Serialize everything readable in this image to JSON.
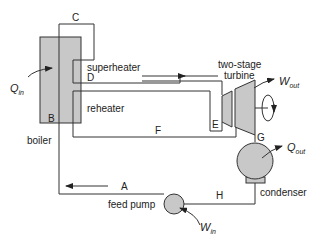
{
  "diagram": {
    "type": "Rankine cycle with reheat",
    "components": {
      "boiler": "boiler",
      "superheater": "superheater",
      "reheater": "reheater",
      "turbine": "two-stage",
      "turbine_line2": "turbine",
      "condenser": "condenser",
      "pump": "feed pump"
    },
    "state_points": {
      "A": "A",
      "B": "B",
      "C": "C",
      "D": "D",
      "E": "E",
      "F": "F",
      "G": "G",
      "H": "H"
    },
    "energy": {
      "q_in": "Q",
      "q_in_sub": "in",
      "q_out": "Q",
      "q_out_sub": "out",
      "w_out": "W",
      "w_out_sub": "out",
      "w_in": "W",
      "w_in_sub": "in"
    },
    "colors": {
      "component_fill": "#c8c8c8",
      "line": "#333333"
    }
  }
}
